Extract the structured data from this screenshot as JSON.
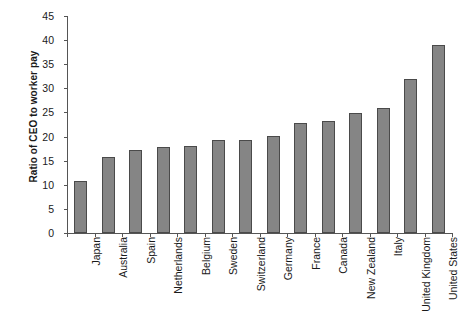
{
  "chart_data": {
    "type": "bar",
    "title": "",
    "subtitle": "",
    "xlabel": "",
    "ylabel": "Ratio of CEO to worker pay",
    "ylim": [
      0,
      45
    ],
    "yticks": [
      0,
      5,
      10,
      15,
      20,
      25,
      30,
      35,
      40,
      45
    ],
    "grid": false,
    "legend": "none",
    "bar_color": "#858585",
    "bar_edge_color": "#4a4a4a",
    "axis_color": "#555555",
    "categories": [
      "Japan",
      "Australia",
      "Spain",
      "Netherlands",
      "Belgium",
      "Sweden",
      "Switzerland",
      "Germany",
      "France",
      "Canada",
      "New Zealand",
      "Italy",
      "United Kingdom",
      "United States"
    ],
    "values": [
      10.8,
      15.8,
      17.2,
      17.9,
      18.1,
      19.3,
      19.3,
      20.1,
      22.9,
      23.2,
      24.9,
      25.9,
      32.0,
      39.0
    ],
    "series": [
      {
        "name": "Ratio of CEO to worker pay",
        "values": [
          10.8,
          15.8,
          17.2,
          17.9,
          18.1,
          19.3,
          19.3,
          20.1,
          22.9,
          23.2,
          24.9,
          25.9,
          32.0,
          39.0
        ]
      }
    ]
  }
}
